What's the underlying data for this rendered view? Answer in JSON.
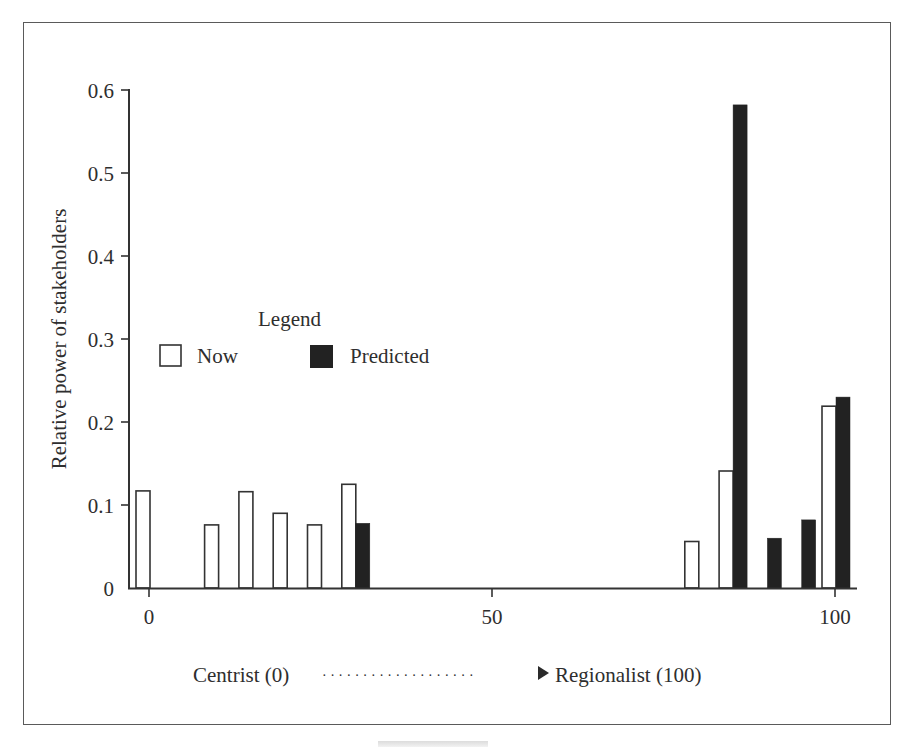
{
  "chart_data": {
    "type": "bar",
    "title": "",
    "xlabel": "Centrist (0) → Regionalist (100)",
    "ylabel": "Relative power of stakeholders",
    "xlim": [
      0,
      100
    ],
    "ylim": [
      0,
      0.6
    ],
    "x_ticks": [
      0,
      50,
      100
    ],
    "x_tick_labels": [
      "0",
      "50",
      "100"
    ],
    "y_ticks": [
      0,
      0.1,
      0.2,
      0.3,
      0.4,
      0.5,
      0.6
    ],
    "y_tick_labels": [
      "0",
      "0.1",
      "0.2",
      "0.3",
      "0.4",
      "0.5",
      "0.6"
    ],
    "grid": false,
    "legend": {
      "title": "Legend",
      "position": "inside-left",
      "entries": [
        {
          "label": "Now",
          "style": "outline"
        },
        {
          "label": "Predicted",
          "style": "filled"
        }
      ]
    },
    "series": [
      {
        "name": "Now",
        "color": "#ffffff",
        "stroke": "#333333",
        "points": [
          {
            "x": 0,
            "y": 0.117
          },
          {
            "x": 10,
            "y": 0.076
          },
          {
            "x": 15,
            "y": 0.116
          },
          {
            "x": 20,
            "y": 0.09
          },
          {
            "x": 25,
            "y": 0.076
          },
          {
            "x": 30,
            "y": 0.125
          },
          {
            "x": 80,
            "y": 0.056
          },
          {
            "x": 85,
            "y": 0.141
          },
          {
            "x": 100,
            "y": 0.219
          }
        ]
      },
      {
        "name": "Predicted",
        "color": "#222222",
        "stroke": "#222222",
        "points": [
          {
            "x": 30,
            "y": 0.078
          },
          {
            "x": 85,
            "y": 0.582
          },
          {
            "x": 90,
            "y": 0.06
          },
          {
            "x": 95,
            "y": 0.082
          },
          {
            "x": 100,
            "y": 0.23
          }
        ]
      }
    ]
  },
  "axis": {
    "ylabel": "Relative power of stakeholders",
    "x_tick_labels": [
      "0",
      "50",
      "100"
    ],
    "y_tick_labels": [
      "0",
      "0.1",
      "0.2",
      "0.3",
      "0.4",
      "0.5",
      "0.6"
    ]
  },
  "legend": {
    "title": "Legend",
    "now_label": "Now",
    "predicted_label": "Predicted"
  },
  "caption": {
    "left": "Centrist (0)",
    "dots": "· · · · · · · · · · · · · · · · · · ·",
    "right": "Regionalist (100)"
  },
  "colors": {
    "now_fill": "#ffffff",
    "now_stroke": "#333333",
    "predicted_fill": "#222222",
    "axis": "#333333",
    "frame": "#5a5a5a"
  }
}
